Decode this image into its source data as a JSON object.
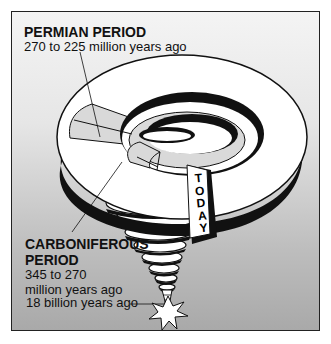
{
  "diagram": {
    "permian": {
      "title": "PERMIAN PERIOD",
      "range": "270 to 225 million years ago"
    },
    "carboniferous": {
      "title_line1": "CARBONIFEROUS",
      "title_line2": "PERIOD",
      "range_line1": "345 to 270",
      "range_line2": "million years ago"
    },
    "origin_label": "18 billion years ago",
    "today_label": [
      "T",
      "O",
      "D",
      "A",
      "Y"
    ],
    "colors": {
      "spiral_fill": "#ffffff",
      "spiral_shadow": "#111111",
      "highlight_band": "#d9d9d9",
      "background_top": "#f4f4f4",
      "background_bottom": "#a9a9a9"
    }
  }
}
